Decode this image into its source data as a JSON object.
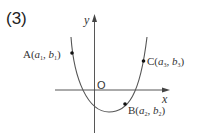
{
  "problem_number": "(3)",
  "axes": {
    "x_label": "x",
    "y_label": "y",
    "origin_label": "O"
  },
  "curve": {
    "type": "parabola",
    "opens": "up",
    "color": "#555555"
  },
  "points": [
    {
      "name": "A",
      "label": "A(a₁, b₁)",
      "main": "A(",
      "a": "a",
      "a_sub": "1",
      "b": "b",
      "b_sub": "1"
    },
    {
      "name": "B",
      "label": "B(a₂, b₂)",
      "main": "B(",
      "a": "a",
      "a_sub": "2",
      "b": "b",
      "b_sub": "2"
    },
    {
      "name": "C",
      "label": "C(a₃, b₃)",
      "main": "C(",
      "a": "a",
      "a_sub": "3",
      "b": "b",
      "b_sub": "3"
    }
  ]
}
